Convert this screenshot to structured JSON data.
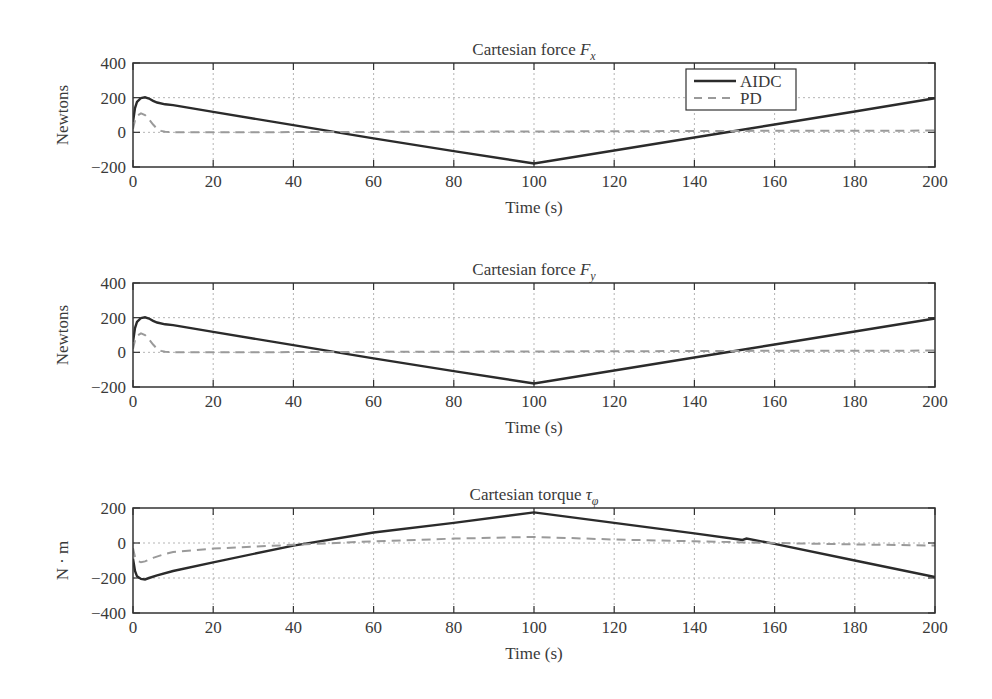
{
  "figure": {
    "width": 992,
    "height": 699,
    "line_color": "#2b2b2b",
    "dash_color": "#9a9a9a",
    "grid_color": "#b5b5b5"
  },
  "legend": {
    "entries": [
      {
        "label": "AIDC",
        "style": "solid"
      },
      {
        "label": "PD",
        "style": "dashed"
      }
    ]
  },
  "chart_data": [
    {
      "type": "line",
      "title": "Cartesian force F",
      "title_main": "Cartesian force ",
      "title_symbol": "F",
      "title_subscript": "x",
      "xlabel": "Time (s)",
      "ylabel": "Newtons",
      "xlim": [
        0,
        200
      ],
      "ylim": [
        -200,
        400
      ],
      "xticks": [
        0,
        20,
        40,
        60,
        80,
        100,
        120,
        140,
        160,
        180,
        200
      ],
      "yticks": [
        -200,
        0,
        200,
        400
      ],
      "ytick_labels": [
        "−200",
        "0",
        "200",
        "400"
      ],
      "grid": true,
      "legend_position": "upper center-right",
      "plot_box": {
        "x0": 133,
        "x1": 935,
        "y0": 63,
        "y1": 167
      },
      "series": [
        {
          "name": "AIDC",
          "style": "solid",
          "x": [
            0,
            0.5,
            1,
            2,
            3,
            4,
            5,
            6,
            8,
            10,
            20,
            40,
            60,
            80,
            100,
            120,
            140,
            160,
            180,
            200
          ],
          "y": [
            60,
            140,
            175,
            198,
            202,
            195,
            182,
            172,
            162,
            157,
            118,
            42,
            -35,
            -108,
            -180,
            -105,
            -30,
            45,
            120,
            197
          ]
        },
        {
          "name": "PD",
          "style": "dashed",
          "x": [
            0,
            0.5,
            1,
            2,
            3,
            4,
            5,
            6,
            7,
            8,
            10,
            20,
            50,
            100,
            150,
            200
          ],
          "y": [
            20,
            70,
            95,
            110,
            100,
            75,
            45,
            20,
            8,
            3,
            0,
            0,
            2,
            5,
            8,
            10
          ]
        }
      ]
    },
    {
      "type": "line",
      "title": "Cartesian force F",
      "title_main": "Cartesian force ",
      "title_symbol": "F",
      "title_subscript": "y",
      "xlabel": "Time (s)",
      "ylabel": "Newtons",
      "xlim": [
        0,
        200
      ],
      "ylim": [
        -200,
        400
      ],
      "xticks": [
        0,
        20,
        40,
        60,
        80,
        100,
        120,
        140,
        160,
        180,
        200
      ],
      "yticks": [
        -200,
        0,
        200,
        400
      ],
      "ytick_labels": [
        "−200",
        "0",
        "200",
        "400"
      ],
      "grid": true,
      "plot_box": {
        "x0": 133,
        "x1": 935,
        "y0": 283,
        "y1": 387
      },
      "series": [
        {
          "name": "AIDC",
          "style": "solid",
          "x": [
            0,
            0.5,
            1,
            2,
            3,
            4,
            5,
            6,
            8,
            10,
            20,
            40,
            60,
            80,
            100,
            120,
            140,
            160,
            180,
            200
          ],
          "y": [
            60,
            140,
            175,
            198,
            202,
            195,
            182,
            172,
            162,
            157,
            118,
            42,
            -35,
            -108,
            -180,
            -105,
            -30,
            45,
            120,
            195
          ]
        },
        {
          "name": "PD",
          "style": "dashed",
          "x": [
            0,
            0.5,
            1,
            2,
            3,
            4,
            5,
            6,
            7,
            8,
            10,
            20,
            50,
            100,
            150,
            200
          ],
          "y": [
            20,
            70,
            95,
            110,
            100,
            75,
            45,
            20,
            8,
            3,
            0,
            0,
            2,
            5,
            8,
            10
          ]
        }
      ]
    },
    {
      "type": "line",
      "title": "Cartesian torque τφ",
      "title_main": "Cartesian torque ",
      "title_symbol": "τ",
      "title_subscript": "φ",
      "xlabel": "Time (s)",
      "ylabel": "N · m",
      "xlim": [
        0,
        200
      ],
      "ylim": [
        -400,
        200
      ],
      "xticks": [
        0,
        20,
        40,
        60,
        80,
        100,
        120,
        140,
        160,
        180,
        200
      ],
      "yticks": [
        -400,
        -200,
        0,
        200
      ],
      "ytick_labels": [
        "−400",
        "−200",
        "0",
        "200"
      ],
      "grid": true,
      "plot_box": {
        "x0": 133,
        "x1": 935,
        "y0": 508,
        "y1": 613
      },
      "series": [
        {
          "name": "AIDC",
          "style": "solid",
          "x": [
            0,
            0.5,
            1,
            2,
            3,
            4,
            6,
            10,
            20,
            40,
            60,
            80,
            100,
            120,
            140,
            152,
            153,
            160,
            180,
            200
          ],
          "y": [
            -90,
            -160,
            -190,
            -205,
            -208,
            -200,
            -185,
            -160,
            -110,
            -15,
            60,
            115,
            175,
            115,
            55,
            18,
            25,
            -5,
            -100,
            -195
          ]
        },
        {
          "name": "PD",
          "style": "dashed",
          "x": [
            0,
            0.5,
            1,
            2,
            3,
            5,
            8,
            10,
            20,
            40,
            60,
            80,
            100,
            120,
            140,
            160,
            180,
            200
          ],
          "y": [
            -30,
            -80,
            -100,
            -110,
            -105,
            -85,
            -62,
            -52,
            -32,
            -10,
            10,
            25,
            35,
            20,
            10,
            0,
            -8,
            -15
          ]
        }
      ]
    }
  ]
}
